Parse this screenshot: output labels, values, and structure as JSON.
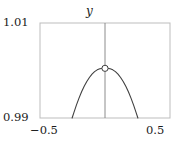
{
  "figure": {
    "title": "y",
    "axis_labels": {
      "y_max": "1.01",
      "y_min": "0.99",
      "x_min": "−0.5",
      "x_max": "0.5"
    }
  },
  "chart_data": {
    "type": "line",
    "title": "y",
    "xlabel": "",
    "ylabel": "y",
    "xlim": [
      -0.5,
      0.5
    ],
    "ylim": [
      0.99,
      1.01
    ],
    "xticks": [
      -0.5,
      0.5
    ],
    "xticklabels": [
      "−0.5",
      "0.5"
    ],
    "yticks": [
      0.99,
      1.01
    ],
    "yticklabels": [
      "0.99",
      "1.01"
    ],
    "grid": false,
    "legend": null,
    "frame": "box",
    "series": [
      {
        "name": "parabola",
        "type": "line",
        "color": "#404040",
        "linewidth": 1.1,
        "comment": "downward parabola peaking at x=0, clipped by the 0.99 lower limit near x=+/-0.25",
        "x": [
          -0.253,
          -0.24,
          -0.22,
          -0.2,
          -0.18,
          -0.16,
          -0.14,
          -0.12,
          -0.1,
          -0.08,
          -0.06,
          -0.04,
          -0.02,
          0.0,
          0.02,
          0.04,
          0.06,
          0.08,
          0.1,
          0.12,
          0.14,
          0.16,
          0.18,
          0.2,
          0.22,
          0.24,
          0.253
        ],
        "y": [
          0.99,
          0.99108,
          0.99271,
          0.99419,
          0.99551,
          0.99667,
          0.99768,
          0.99853,
          0.99922,
          0.99976,
          1.00014,
          1.00037,
          1.00044,
          1.00046,
          1.00044,
          1.00037,
          1.00014,
          0.99976,
          0.99922,
          0.99853,
          0.99768,
          0.99667,
          0.99551,
          0.99419,
          0.99271,
          0.99108,
          0.99
        ]
      },
      {
        "name": "vertical-line",
        "type": "vline",
        "color": "#808080",
        "linewidth": 0.9,
        "x": 0.0,
        "y_range": [
          0.99,
          1.01
        ]
      }
    ],
    "markers": [
      {
        "name": "peak-marker",
        "style": "open-circle",
        "x": 0.0,
        "y": 1.00046,
        "facecolor": "#ffffff",
        "edgecolor": "#404040",
        "size": 5
      }
    ],
    "colors": {
      "curve": "#404040",
      "vline": "#808080",
      "frame": "#bdbdbd",
      "text": "#1a1a1a",
      "background": "#ffffff"
    }
  }
}
